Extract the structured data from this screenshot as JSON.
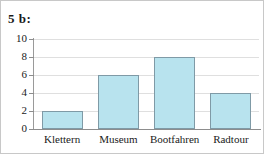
{
  "title": "5 b:",
  "chart_data": {
    "type": "bar",
    "title": "5 b:",
    "xlabel": "",
    "ylabel": "",
    "categories": [
      "Klettern",
      "Museum",
      "Bootfahren",
      "Radtour"
    ],
    "values": [
      2,
      6,
      8,
      4
    ],
    "ylim": [
      0,
      10
    ],
    "ytick_labels": [
      "0",
      "2",
      "4",
      "6",
      "8",
      "10"
    ],
    "ytick_values": [
      0,
      2,
      4,
      6,
      8,
      10
    ],
    "grid": true,
    "legend": false,
    "bar_fill_color": "#b8e3ee",
    "bar_border_color": "#7f9aa6",
    "gridline_color": "#dfdfdf",
    "axis_color": "#8d8d8d"
  }
}
